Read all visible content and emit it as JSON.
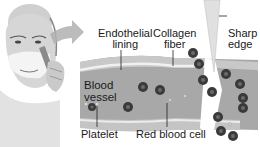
{
  "figure": {
    "type": "medical-illustration",
    "colors": {
      "vessel_wall": "#bdbdbd",
      "vessel_lumen": "#9a9a9a",
      "red_blood_cell": "#3a3a3a",
      "rbc_center": "#6a6a6a",
      "lining": "#e6e6e6",
      "arrow": "#b0b0b0",
      "skin": "#d2d2d2",
      "label_text": "#1a1a1a"
    }
  },
  "labels": {
    "endothelial_lining": [
      "Endothelial",
      "lining"
    ],
    "collagen_fiber": [
      "Collagen",
      "fiber"
    ],
    "sharp_edge": [
      "Sharp",
      "edge"
    ],
    "blood_vessel": [
      "Blood",
      "vessel"
    ],
    "platelet": "Platelet",
    "red_blood_cell": "Red blood cell"
  }
}
